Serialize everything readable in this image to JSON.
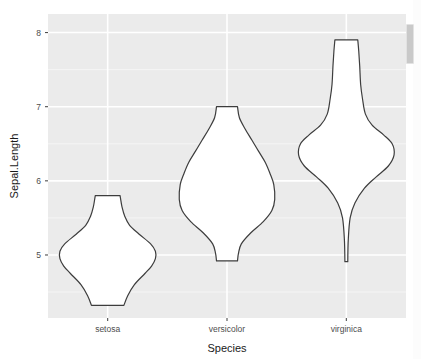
{
  "chart_data": {
    "type": "violin",
    "title": "",
    "subtitle": "",
    "xlabel": "Species",
    "ylabel": "Sepal.Length",
    "categories": [
      "setosa",
      "versicolor",
      "virginica"
    ],
    "x_tick_labels": [
      "setosa",
      "versicolor",
      "virginica"
    ],
    "y_tick_labels": [
      "5",
      "6",
      "7",
      "8"
    ],
    "y_ticks": [
      5,
      6,
      7,
      8
    ],
    "ylim": [
      4.15,
      8.25
    ],
    "grid": true,
    "grid_major_color": "#ffffff",
    "grid_minor_color": "#f5f5f5",
    "panel_bg_color": "#ebebeb",
    "violin_fill_color": "#ffffff",
    "violin_line_color": "#3d3d3d",
    "legend_position": "none",
    "series": [
      {
        "name": "setosa",
        "min": 4.3,
        "max": 5.8,
        "median": 5.0,
        "mean": 5.006,
        "n": 50,
        "density_profile": [
          {
            "value": 4.3,
            "width": 0.0
          },
          {
            "value": 4.32,
            "width": 0.34
          },
          {
            "value": 4.45,
            "width": 0.42
          },
          {
            "value": 4.6,
            "width": 0.56
          },
          {
            "value": 4.75,
            "width": 0.78
          },
          {
            "value": 4.85,
            "width": 0.92
          },
          {
            "value": 4.95,
            "width": 1.0
          },
          {
            "value": 5.05,
            "width": 1.0
          },
          {
            "value": 5.15,
            "width": 0.9
          },
          {
            "value": 5.28,
            "width": 0.66
          },
          {
            "value": 5.4,
            "width": 0.46
          },
          {
            "value": 5.52,
            "width": 0.36
          },
          {
            "value": 5.65,
            "width": 0.3
          },
          {
            "value": 5.76,
            "width": 0.27
          },
          {
            "value": 5.8,
            "width": 0.26
          },
          {
            "value": 5.8,
            "width": 0.0
          }
        ]
      },
      {
        "name": "versicolor",
        "min": 4.9,
        "max": 7.0,
        "median": 5.9,
        "mean": 5.936,
        "n": 50,
        "density_profile": [
          {
            "value": 4.9,
            "width": 0.0
          },
          {
            "value": 4.92,
            "width": 0.22
          },
          {
            "value": 5.02,
            "width": 0.24
          },
          {
            "value": 5.15,
            "width": 0.3
          },
          {
            "value": 5.3,
            "width": 0.5
          },
          {
            "value": 5.45,
            "width": 0.76
          },
          {
            "value": 5.6,
            "width": 0.94
          },
          {
            "value": 5.75,
            "width": 1.0
          },
          {
            "value": 5.95,
            "width": 0.98
          },
          {
            "value": 6.1,
            "width": 0.9
          },
          {
            "value": 6.25,
            "width": 0.8
          },
          {
            "value": 6.4,
            "width": 0.66
          },
          {
            "value": 6.55,
            "width": 0.52
          },
          {
            "value": 6.7,
            "width": 0.38
          },
          {
            "value": 6.85,
            "width": 0.26
          },
          {
            "value": 7.0,
            "width": 0.22
          },
          {
            "value": 7.0,
            "width": 0.0
          }
        ]
      },
      {
        "name": "virginica",
        "min": 4.9,
        "max": 7.9,
        "median": 6.5,
        "mean": 6.588,
        "n": 50,
        "density_profile": [
          {
            "value": 4.9,
            "width": 0.0
          },
          {
            "value": 4.91,
            "width": 0.03
          },
          {
            "value": 5.2,
            "width": 0.04
          },
          {
            "value": 5.5,
            "width": 0.08
          },
          {
            "value": 5.7,
            "width": 0.18
          },
          {
            "value": 5.9,
            "width": 0.38
          },
          {
            "value": 6.05,
            "width": 0.62
          },
          {
            "value": 6.2,
            "width": 0.88
          },
          {
            "value": 6.35,
            "width": 1.0
          },
          {
            "value": 6.5,
            "width": 0.96
          },
          {
            "value": 6.62,
            "width": 0.78
          },
          {
            "value": 6.75,
            "width": 0.54
          },
          {
            "value": 6.9,
            "width": 0.4
          },
          {
            "value": 7.1,
            "width": 0.34
          },
          {
            "value": 7.3,
            "width": 0.3
          },
          {
            "value": 7.55,
            "width": 0.28
          },
          {
            "value": 7.75,
            "width": 0.26
          },
          {
            "value": 7.9,
            "width": 0.24
          },
          {
            "value": 7.9,
            "width": 0.0
          }
        ]
      }
    ]
  },
  "scrollbar": {
    "name": "vertical-scrollbar"
  }
}
